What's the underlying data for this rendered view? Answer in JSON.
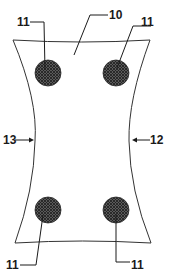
{
  "figure": {
    "type": "patent-style line drawing",
    "shape": "hourglass / waisted panel outline",
    "colors": {
      "line": "#333333",
      "dot_fill": "#4a4a4a",
      "dot_dark": "#222222",
      "background": "#ffffff"
    },
    "reference_numerals": {
      "panel": "10",
      "dot_top_left": "11",
      "dot_top_right": "11",
      "dot_bottom_left": "11",
      "dot_bottom_right": "11",
      "right_edge": "12",
      "left_edge": "13"
    },
    "dots": [
      {
        "name": "top-left",
        "cx": 48,
        "cy": 73,
        "r": 13
      },
      {
        "name": "top-right",
        "cx": 116,
        "cy": 73,
        "r": 13
      },
      {
        "name": "bottom-left",
        "cx": 48,
        "cy": 210,
        "r": 13
      },
      {
        "name": "bottom-right",
        "cx": 116,
        "cy": 210,
        "r": 13
      }
    ]
  }
}
